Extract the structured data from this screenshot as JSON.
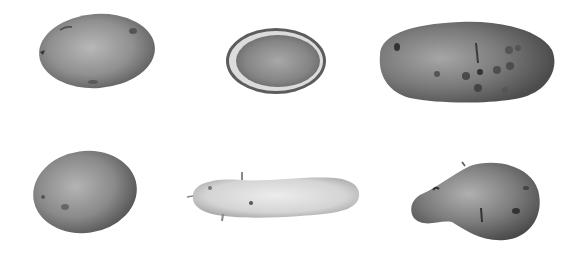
{
  "image": {
    "description": "Grayscale botanical illustration of six potato tubers arranged in two rows of three",
    "background": "#ffffff",
    "layout": {
      "rows": 2,
      "columns": 3
    },
    "items": [
      {
        "id": "potato-top-left",
        "kind": "whole round-oval tuber",
        "tone": "#8a8a8a"
      },
      {
        "id": "potato-top-middle",
        "kind": "cross-section cut tuber",
        "tone": "#7c7c7c"
      },
      {
        "id": "potato-top-right",
        "kind": "elongated tuber with dark spots (scab lesions)",
        "tone": "#6e6e6e"
      },
      {
        "id": "potato-bottom-left",
        "kind": "whole round tuber",
        "tone": "#858585"
      },
      {
        "id": "potato-bottom-middle",
        "kind": "long pale fingerling tuber with sprouts",
        "tone": "#d2d2d2"
      },
      {
        "id": "potato-bottom-right",
        "kind": "pear-shaped irregular tuber",
        "tone": "#777777"
      }
    ]
  }
}
